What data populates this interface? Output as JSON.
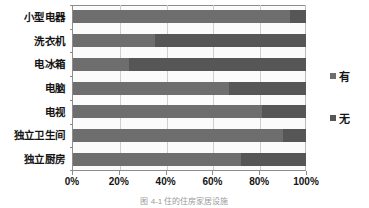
{
  "chart_data": {
    "type": "bar",
    "orientation": "horizontal",
    "stacked": true,
    "normalized_percent": true,
    "title": "",
    "xlabel": "",
    "ylabel": "",
    "xlim": [
      0,
      100
    ],
    "xticks": [
      "0%",
      "20%",
      "40%",
      "60%",
      "80%",
      "100%"
    ],
    "xtick_values": [
      0,
      20,
      40,
      60,
      80,
      100
    ],
    "grid": true,
    "grid_axis": "x",
    "legend_position": "right",
    "categories": [
      "小型电器",
      "洗衣机",
      "电冰箱",
      "电脑",
      "电视",
      "独立卫生间",
      "独立厨房"
    ],
    "series": [
      {
        "name": "有",
        "color": "#6e6e6e",
        "values": [
          93,
          35,
          24,
          67,
          81,
          90,
          72
        ]
      },
      {
        "name": "无",
        "color": "#565656",
        "values": [
          7,
          65,
          76,
          33,
          19,
          10,
          28
        ]
      }
    ]
  },
  "legend": {
    "items": [
      {
        "label": "有",
        "color": "#6e6e6e"
      },
      {
        "label": "无",
        "color": "#565656"
      }
    ]
  },
  "caption": "图 4-1  住的住房家居设施",
  "colors": {
    "axis": "#8d8d8d",
    "grid": "#cfcfcf",
    "plot_background": "#fbfbfb",
    "text": "#141414"
  }
}
